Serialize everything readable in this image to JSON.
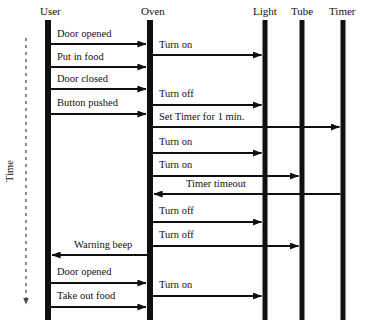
{
  "diagram": {
    "kind": "uml-sequence-diagram",
    "background_color": "#ffffff",
    "ink_color": "#101010",
    "time_axis": {
      "label": "Time",
      "direction": "downward",
      "style": "dashed-arrow",
      "x": 26,
      "y_start": 38,
      "y_end": 304
    },
    "lifelines": [
      {
        "id": "user",
        "label": "User",
        "x": 48,
        "label_x": 40,
        "label_y": 15,
        "bar_top": 20,
        "bar_bottom": 320,
        "bar_width": 6
      },
      {
        "id": "oven",
        "label": "Oven",
        "x": 150,
        "label_x": 141,
        "label_y": 15,
        "bar_top": 20,
        "bar_bottom": 320,
        "bar_width": 6
      },
      {
        "id": "light",
        "label": "Light",
        "x": 265,
        "label_x": 253,
        "label_y": 15,
        "bar_top": 20,
        "bar_bottom": 320,
        "bar_width": 5
      },
      {
        "id": "tube",
        "label": "Tube",
        "x": 302,
        "label_x": 291,
        "label_y": 15,
        "bar_top": 20,
        "bar_bottom": 320,
        "bar_width": 5
      },
      {
        "id": "timer",
        "label": "Timer",
        "x": 343,
        "label_x": 329,
        "label_y": 15,
        "bar_top": 20,
        "bar_bottom": 320,
        "bar_width": 5
      }
    ],
    "messages": [
      {
        "label": "Door opened",
        "from": "user",
        "to": "oven",
        "y": 44,
        "direction": "right",
        "label_x": 57,
        "label_y": 37
      },
      {
        "label": "Turn on",
        "from": "oven",
        "to": "light",
        "y": 55,
        "direction": "right",
        "label_x": 159,
        "label_y": 48
      },
      {
        "label": "Put in food",
        "from": "user",
        "to": "oven",
        "y": 67,
        "direction": "right",
        "label_x": 57,
        "label_y": 60
      },
      {
        "label": "Door closed",
        "from": "user",
        "to": "oven",
        "y": 89,
        "direction": "right",
        "label_x": 57,
        "label_y": 82
      },
      {
        "label": "Turn off",
        "from": "oven",
        "to": "light",
        "y": 105,
        "direction": "right",
        "label_x": 159,
        "label_y": 97
      },
      {
        "label": "Button pushed",
        "from": "user",
        "to": "oven",
        "y": 114,
        "direction": "right",
        "label_x": 57,
        "label_y": 106
      },
      {
        "label": "Set Timer for 1 min.",
        "from": "oven",
        "to": "timer",
        "y": 127,
        "direction": "right",
        "label_x": 159,
        "label_y": 120
      },
      {
        "label": "Turn on",
        "from": "oven",
        "to": "light",
        "y": 153,
        "direction": "right",
        "label_x": 159,
        "label_y": 145
      },
      {
        "label": "Turn on",
        "from": "oven",
        "to": "tube",
        "y": 176,
        "direction": "right",
        "label_x": 159,
        "label_y": 168
      },
      {
        "label": "Timer timeout",
        "from": "timer",
        "to": "oven",
        "y": 194,
        "direction": "left",
        "label_x": 186,
        "label_y": 187
      },
      {
        "label": "Turn off",
        "from": "oven",
        "to": "light",
        "y": 222,
        "direction": "right",
        "label_x": 159,
        "label_y": 214
      },
      {
        "label": "Turn off",
        "from": "oven",
        "to": "tube",
        "y": 246,
        "direction": "right",
        "label_x": 159,
        "label_y": 238
      },
      {
        "label": "Warning beep",
        "from": "oven",
        "to": "user",
        "y": 255,
        "direction": "left",
        "label_x": 74,
        "label_y": 248
      },
      {
        "label": "Door opened",
        "from": "user",
        "to": "oven",
        "y": 283,
        "direction": "right",
        "label_x": 57,
        "label_y": 275
      },
      {
        "label": "Turn on",
        "from": "oven",
        "to": "light",
        "y": 296,
        "direction": "right",
        "label_x": 159,
        "label_y": 288
      },
      {
        "label": "Take out food",
        "from": "user",
        "to": "oven",
        "y": 307,
        "direction": "right",
        "label_x": 57,
        "label_y": 299
      }
    ]
  }
}
